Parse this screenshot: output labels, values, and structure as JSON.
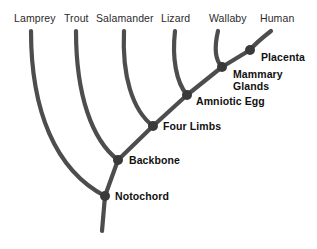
{
  "diagram": {
    "type": "cladogram",
    "background_color": "#ffffff",
    "branch_color": "#4d4d4d",
    "node_color": "#3a3a3a",
    "taxon_label_color": "#2b2b2b",
    "trait_label_color": "#111111"
  },
  "taxa": [
    {
      "label": "Lamprey",
      "label_x": 14,
      "label_y": 12,
      "tip_x": 31,
      "tip_y": 31
    },
    {
      "label": "Trout",
      "label_x": 64,
      "label_y": 12,
      "tip_x": 76,
      "tip_y": 31
    },
    {
      "label": "Salamander",
      "label_x": 96,
      "label_y": 12,
      "tip_x": 124,
      "tip_y": 31
    },
    {
      "label": "Lizard",
      "label_x": 161,
      "label_y": 12,
      "tip_x": 175,
      "tip_y": 31
    },
    {
      "label": "Wallaby",
      "label_x": 209,
      "label_y": 12,
      "tip_x": 218,
      "tip_y": 31
    },
    {
      "label": "Human",
      "label_x": 260,
      "label_y": 12,
      "tip_x": 271,
      "tip_y": 31
    }
  ],
  "traits": [
    {
      "label": "Notochord",
      "node_x": 105,
      "node_y": 196,
      "label_x": 115,
      "label_y": 191,
      "lines": [
        "Notochord"
      ]
    },
    {
      "label": "Backbone",
      "node_x": 118,
      "node_y": 160,
      "label_x": 129,
      "label_y": 155,
      "lines": [
        "Backbone"
      ]
    },
    {
      "label": "Four Limbs",
      "node_x": 153,
      "node_y": 126,
      "label_x": 163,
      "label_y": 121,
      "lines": [
        "Four Limbs"
      ]
    },
    {
      "label": "Amniotic Egg",
      "node_x": 187,
      "node_y": 95,
      "label_x": 196,
      "label_y": 96,
      "lines": [
        "Amniotic Egg"
      ]
    },
    {
      "label": "Mammary Glands",
      "node_x": 222,
      "node_y": 67,
      "label_x": 233,
      "label_y": 69,
      "lines": [
        "Mammary",
        "Glands"
      ]
    },
    {
      "label": "Placenta",
      "node_x": 250,
      "node_y": 50,
      "label_x": 261,
      "label_y": 52,
      "lines": [
        "Placenta"
      ]
    }
  ],
  "root": {
    "stem_top_x": 105,
    "stem_top_y": 196,
    "stem_bottom_x": 102,
    "stem_bottom_y": 231
  },
  "branches": [
    {
      "name": "lamprey-branch",
      "path": "M 31 31 C 31 110, 55 170, 105 196"
    },
    {
      "name": "trout-branch",
      "path": "M 76 31 C 76 95, 92 140, 118 160"
    },
    {
      "name": "salamander-branch",
      "path": "M 124 31 C 122 75, 132 110, 153 126"
    },
    {
      "name": "lizard-branch",
      "path": "M 175 31 C 172 58, 176 82, 187 95"
    },
    {
      "name": "wallaby-branch",
      "path": "M 218 31 C 214 48, 215 60, 222 67"
    },
    {
      "name": "human-branch",
      "path": "M 271 31 C 262 38, 254 45, 250 50"
    },
    {
      "name": "spine-notochord-backbone",
      "path": "M 105 196 L 118 160"
    },
    {
      "name": "spine-backbone-fourlimbs",
      "path": "M 118 160 L 153 126"
    },
    {
      "name": "spine-fourlimbs-amniotic",
      "path": "M 153 126 L 187 95"
    },
    {
      "name": "spine-amniotic-mammary",
      "path": "M 187 95 L 222 67"
    },
    {
      "name": "spine-mammary-placenta",
      "path": "M 222 67 L 250 50"
    },
    {
      "name": "root-stem",
      "path": "M 105 196 L 102 231"
    }
  ]
}
